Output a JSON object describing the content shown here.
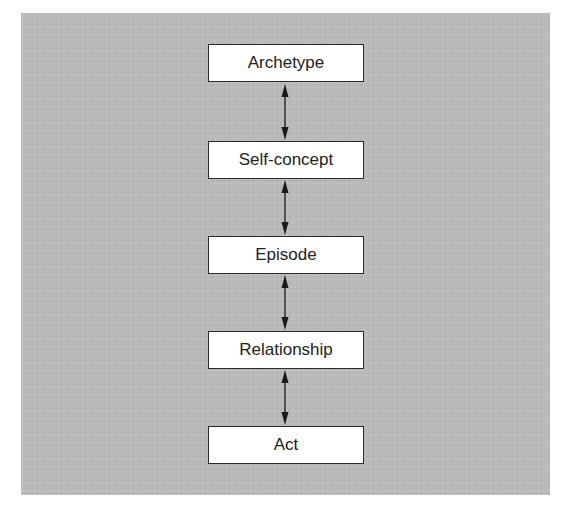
{
  "diagram": {
    "type": "vertical-hierarchy",
    "background_color": "#b9b9b9",
    "node_fill": "#ffffff",
    "node_border": "#2a2a2a",
    "arrow_color": "#1a1a1a",
    "nodes": [
      {
        "label": "Archetype"
      },
      {
        "label": "Self-concept"
      },
      {
        "label": "Episode"
      },
      {
        "label": "Relationship"
      },
      {
        "label": "Act"
      }
    ],
    "edges": [
      {
        "from": "Archetype",
        "to": "Self-concept",
        "style": "bidirectional-arrow"
      },
      {
        "from": "Self-concept",
        "to": "Episode",
        "style": "bidirectional-arrow"
      },
      {
        "from": "Episode",
        "to": "Relationship",
        "style": "bidirectional-arrow"
      },
      {
        "from": "Relationship",
        "to": "Act",
        "style": "bidirectional-arrow"
      }
    ]
  }
}
